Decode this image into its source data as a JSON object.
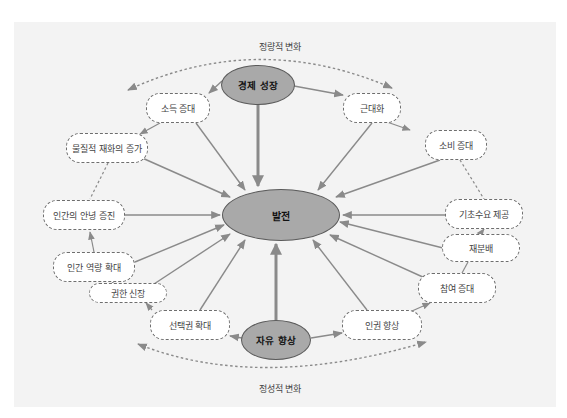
{
  "diagram": {
    "title_top": "정량적 변화",
    "title_bottom": "정성적 변화",
    "center": {
      "label": "발전"
    },
    "hubs": {
      "economic_growth": {
        "label": "경제 성장"
      },
      "freedom_improvement": {
        "label": "자유 향상"
      }
    },
    "nodes": [
      {
        "id": "income",
        "label": "소득 증대"
      },
      {
        "id": "modernization",
        "label": "근대화"
      },
      {
        "id": "material_goods",
        "label": "물질적 재화의 증가"
      },
      {
        "id": "consumption",
        "label": "소비 증대"
      },
      {
        "id": "wellbeing",
        "label": "인간의 안녕 증진"
      },
      {
        "id": "basic_needs",
        "label": "기초수요 제공"
      },
      {
        "id": "capability",
        "label": "인간 역량 확대"
      },
      {
        "id": "redistribution",
        "label": "재분배"
      },
      {
        "id": "participation",
        "label": "참여 증대"
      },
      {
        "id": "empowerment",
        "label": "권한 신장"
      },
      {
        "id": "choice",
        "label": "선택권 확대"
      },
      {
        "id": "human_rights",
        "label": "인권 향상"
      }
    ],
    "colors": {
      "panel": "#f3f3f3",
      "oval_fill": "#a9a9a9",
      "arrow": "#8a8a8a",
      "dashed_border": "#6e6e6e"
    }
  }
}
